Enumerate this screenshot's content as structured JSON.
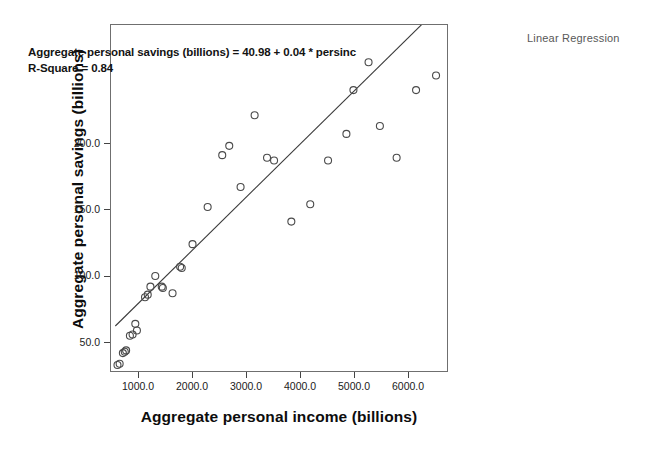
{
  "caption": "Linear Regression",
  "annotation": {
    "equation": "Aggregate personal savings (billions) = 40.98 + 0.04 * persinc",
    "r_square": "R-Square = 0.84"
  },
  "chart_data": {
    "type": "scatter",
    "title": "Linear Regression",
    "xlabel": "Aggregate personal income (billions)",
    "ylabel": "Aggregate personal savings (billions)",
    "xlim": [
      480,
      6740
    ],
    "ylim": [
      28,
      290
    ],
    "grid": false,
    "legend": "none",
    "marker": "open-circle",
    "xticks": [
      "1000.0",
      "2000.0",
      "3000.0",
      "4000.0",
      "5000.0",
      "6000.0"
    ],
    "xtick_values": [
      1000,
      2000,
      3000,
      4000,
      5000,
      6000
    ],
    "yticks": [
      "50.0",
      "100.0",
      "150.0",
      "200.0"
    ],
    "ytick_values": [
      50,
      100,
      150,
      200
    ],
    "fit": {
      "kind": "linear",
      "intercept": 40.98,
      "slope": 0.04,
      "r_square": 0.84,
      "label": "Aggregate personal savings (billions) = 40.98 + 0.04 * persinc",
      "x_start": 560,
      "x_end": 6560
    },
    "points": [
      {
        "x": 600,
        "y": 34
      },
      {
        "x": 640,
        "y": 35
      },
      {
        "x": 700,
        "y": 43
      },
      {
        "x": 735,
        "y": 44
      },
      {
        "x": 760,
        "y": 45
      },
      {
        "x": 830,
        "y": 56
      },
      {
        "x": 880,
        "y": 57
      },
      {
        "x": 930,
        "y": 65
      },
      {
        "x": 960,
        "y": 60
      },
      {
        "x": 1110,
        "y": 85
      },
      {
        "x": 1160,
        "y": 87
      },
      {
        "x": 1210,
        "y": 93
      },
      {
        "x": 1300,
        "y": 101
      },
      {
        "x": 1420,
        "y": 93
      },
      {
        "x": 1440,
        "y": 92
      },
      {
        "x": 1620,
        "y": 88
      },
      {
        "x": 1760,
        "y": 108
      },
      {
        "x": 1790,
        "y": 107
      },
      {
        "x": 1990,
        "y": 125
      },
      {
        "x": 2270,
        "y": 153
      },
      {
        "x": 2540,
        "y": 192
      },
      {
        "x": 2670,
        "y": 199
      },
      {
        "x": 2880,
        "y": 168
      },
      {
        "x": 3140,
        "y": 222
      },
      {
        "x": 3370,
        "y": 190
      },
      {
        "x": 3500,
        "y": 188
      },
      {
        "x": 3820,
        "y": 142
      },
      {
        "x": 4170,
        "y": 155
      },
      {
        "x": 4500,
        "y": 188
      },
      {
        "x": 4840,
        "y": 208
      },
      {
        "x": 4970,
        "y": 241
      },
      {
        "x": 5250,
        "y": 262
      },
      {
        "x": 5460,
        "y": 214
      },
      {
        "x": 5770,
        "y": 190
      },
      {
        "x": 6130,
        "y": 241
      },
      {
        "x": 6500,
        "y": 252
      }
    ]
  }
}
